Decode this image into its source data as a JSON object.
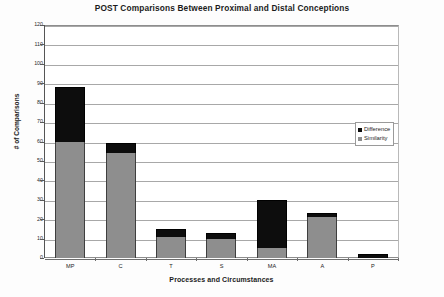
{
  "chart_data": {
    "type": "bar",
    "title": "POST Comparisons Between Proximal and Distal Conceptions",
    "subtitle": "",
    "xlabel": "Processes and Circumstances",
    "ylabel": "# of Comparisons",
    "stacked": true,
    "grid": true,
    "legend_position": "right-middle",
    "ylim": [
      0,
      120
    ],
    "yticks": [
      0,
      10,
      20,
      30,
      40,
      50,
      60,
      70,
      80,
      90,
      100,
      110,
      120
    ],
    "ytick_labels": [
      "0",
      "10",
      "20",
      "30",
      "40",
      "50",
      "60",
      "70",
      "80",
      "90",
      "100",
      "110",
      "120"
    ],
    "categories": [
      "MP",
      "C",
      "T",
      "S",
      "MA",
      "A",
      "P"
    ],
    "series": [
      {
        "name": "Difference",
        "color": "#0d0d0d",
        "values": [
          28,
          5,
          4,
          3,
          25,
          2,
          2
        ]
      },
      {
        "name": "Similarity",
        "color": "#8e8e8e",
        "values": [
          60,
          54,
          11,
          10,
          5,
          21,
          0
        ]
      }
    ],
    "totals": [
      88,
      59,
      15,
      13,
      30,
      23,
      2
    ]
  },
  "legend": {
    "items": [
      {
        "label": "Difference",
        "color": "#0d0d0d"
      },
      {
        "label": "Similarity",
        "color": "#8e8e8e"
      }
    ]
  }
}
